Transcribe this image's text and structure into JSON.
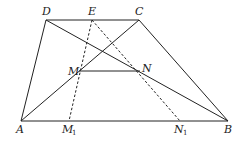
{
  "diagram": {
    "type": "geometry-figure",
    "points": {
      "A": {
        "label": "A",
        "x": 21,
        "y": 121
      },
      "B": {
        "label": "B",
        "x": 228,
        "y": 121
      },
      "C": {
        "label": "C",
        "x": 139,
        "y": 20
      },
      "D": {
        "label": "D",
        "x": 46,
        "y": 20
      },
      "E": {
        "label": "E",
        "x": 92,
        "y": 20
      },
      "M": {
        "label": "M",
        "x": 79,
        "y": 71
      },
      "N": {
        "label": "N",
        "x": 140,
        "y": 71
      },
      "M1": {
        "label": "M",
        "sub": "1",
        "x": 69,
        "y": 121
      },
      "N1": {
        "label": "N",
        "sub": "1",
        "x": 180,
        "y": 121
      }
    },
    "labels": {
      "A": "A",
      "B": "B",
      "C": "C",
      "D": "D",
      "E": "E",
      "M": "M",
      "N": "N",
      "M1": "M",
      "M1_sub": "1",
      "N1": "N",
      "N1_sub": "1"
    },
    "solid_segments": [
      [
        "A",
        "B"
      ],
      [
        "B",
        "C"
      ],
      [
        "C",
        "D"
      ],
      [
        "D",
        "A"
      ],
      [
        "A",
        "C"
      ],
      [
        "D",
        "B"
      ],
      [
        "M",
        "N"
      ]
    ],
    "dashed_segments": [
      [
        "E",
        "M1"
      ],
      [
        "E",
        "N1"
      ]
    ],
    "colors": {
      "line": "#222222",
      "background": "#ffffff"
    }
  }
}
